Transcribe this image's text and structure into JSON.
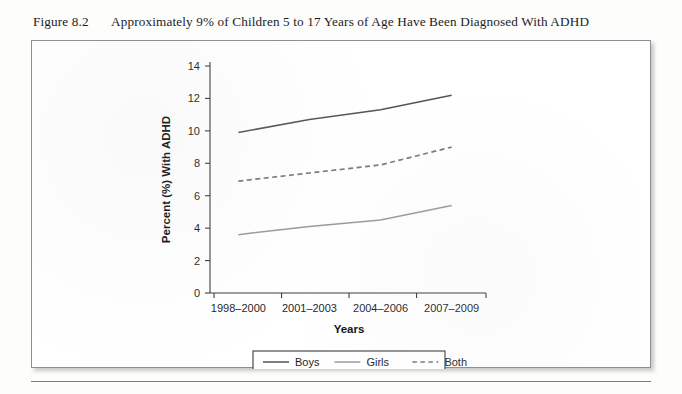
{
  "caption": {
    "figure_number": "Figure 8.2",
    "title": "Approximately 9% of Children 5 to 17 Years of Age Have Been Diagnosed With ADHD"
  },
  "chart_data": {
    "type": "line",
    "title": "Approximately 9% of Children 5 to 17 Years of Age Have Been Diagnosed With ADHD",
    "xlabel": "Years",
    "ylabel": "Percent (%) With ADHD",
    "categories": [
      "1998–2000",
      "2001–2003",
      "2004–2006",
      "2007–2009"
    ],
    "ylim": [
      0,
      14
    ],
    "yticks": [
      0,
      2,
      4,
      6,
      8,
      10,
      12,
      14
    ],
    "ytick_labels": [
      "0",
      "2",
      "4",
      "6",
      "8",
      "10",
      "12",
      "14"
    ],
    "grid": false,
    "legend_position": "bottom-center",
    "series": [
      {
        "name": "Boys",
        "values": [
          9.9,
          10.7,
          11.3,
          12.2
        ],
        "color": "#555555",
        "style": "solid"
      },
      {
        "name": "Girls",
        "values": [
          3.6,
          4.1,
          4.5,
          5.4
        ],
        "color": "#9a9a9a",
        "style": "solid"
      },
      {
        "name": "Both",
        "values": [
          6.9,
          7.4,
          7.9,
          9.0
        ],
        "color": "#7a7a7a",
        "style": "dashed"
      }
    ]
  },
  "colors": {
    "boys": "#555555",
    "girls": "#9a9a9a",
    "both": "#7a7a7a",
    "axis": "#3b3b3b",
    "panel_border": "#8f8f8f"
  }
}
